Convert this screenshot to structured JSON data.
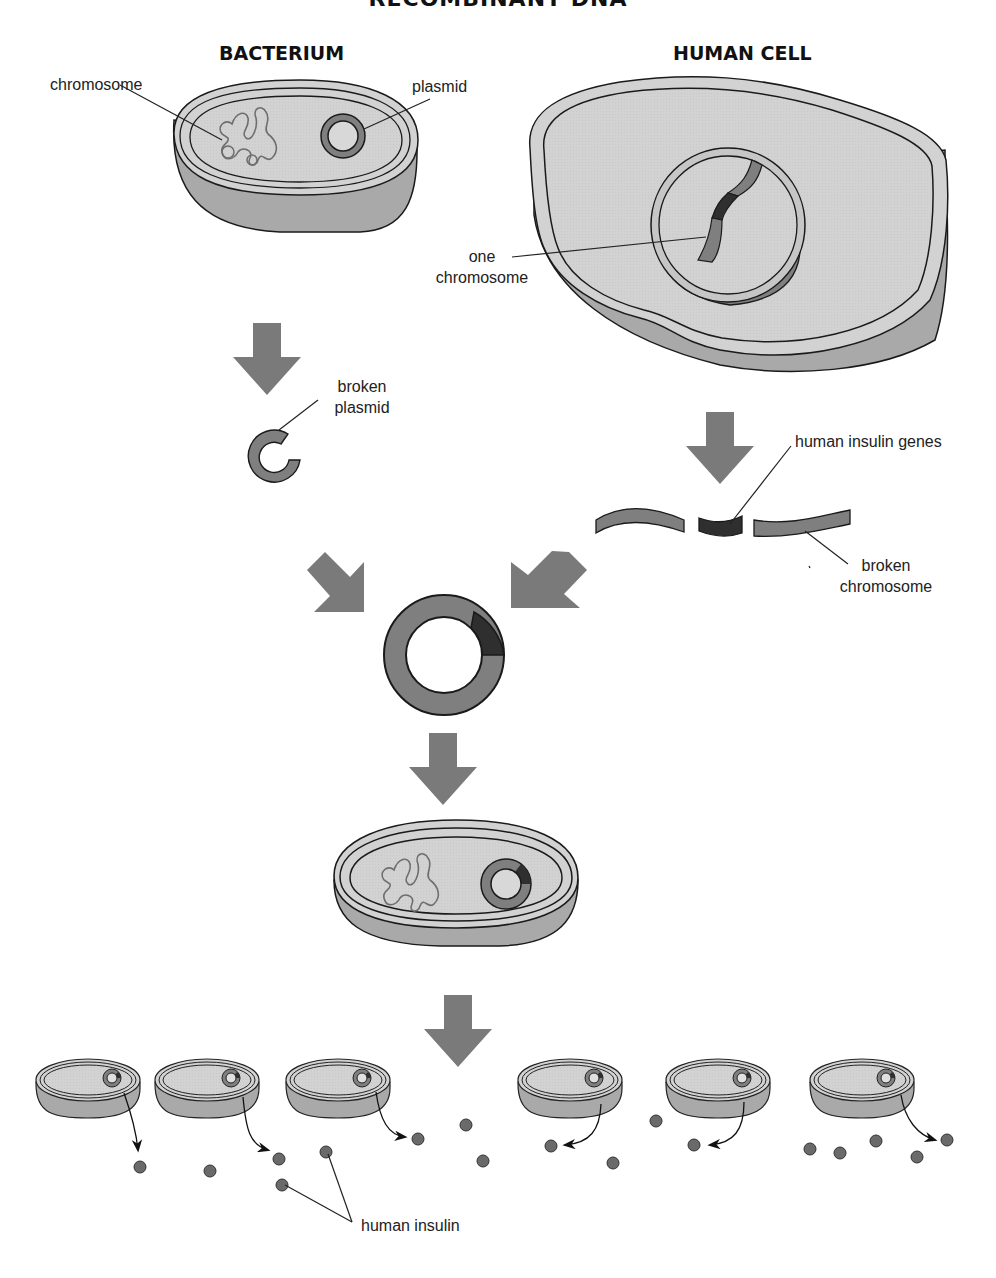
{
  "title": "RECOMBINANT DNA",
  "headings": {
    "bacterium": "BACTERIUM",
    "human_cell": "HUMAN CELL"
  },
  "labels": {
    "chromosome": "chromosome",
    "plasmid": "plasmid",
    "one_chromosome_line1": "one",
    "one_chromosome_line2": "chromosome",
    "broken_plasmid_line1": "broken",
    "broken_plasmid_line2": "plasmid",
    "human_insulin_genes": "human insulin genes",
    "broken_chromosome_line1": "broken",
    "broken_chromosome_line2": "chromosome",
    "human_insulin": "human insulin"
  },
  "colors": {
    "cell_top": "#d2d2d2",
    "cell_side": "#a9a9a9",
    "plasmid": "#7f7f7f",
    "arrow": "#7a7a7a",
    "gene": "#2f2f2f",
    "outline": "#1a1a1a"
  },
  "steps": [
    "Bacterium with chromosome and plasmid",
    "Human cell nucleus with one chromosome",
    "Plasmid is broken",
    "Chromosome broken to isolate human insulin genes",
    "Insulin gene inserted into plasmid (recombinant plasmid)",
    "Recombinant plasmid placed into bacterium",
    "Bacteria multiply and secrete human insulin"
  ],
  "offspring_bacteria_count": 6
}
